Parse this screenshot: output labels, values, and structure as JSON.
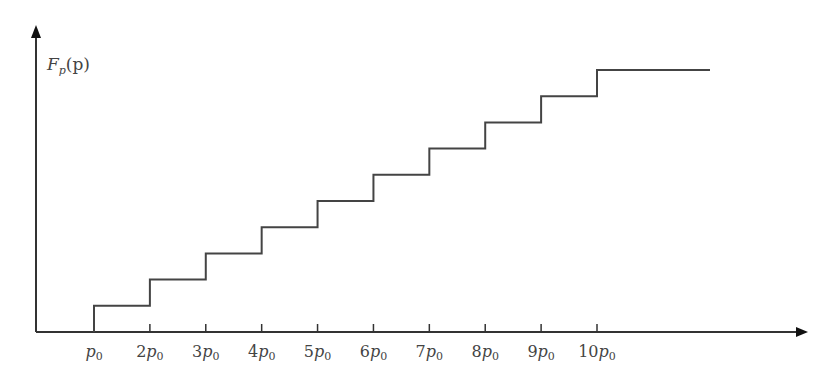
{
  "chart_data": {
    "type": "line",
    "subtype": "step",
    "title": "",
    "ylabel": "F_p(p)",
    "ylabel_display": {
      "main": "F",
      "sub": "p",
      "rest": "(p)"
    },
    "xlabel": "",
    "categories": [
      "p0",
      "2p0",
      "3p0",
      "4p0",
      "5p0",
      "6p0",
      "7p0",
      "8p0",
      "9p0",
      "10p0"
    ],
    "tick_labels": [
      {
        "coef": "",
        "sym": "p",
        "sub": "0"
      },
      {
        "coef": "2",
        "sym": "p",
        "sub": "0"
      },
      {
        "coef": "3",
        "sym": "p",
        "sub": "0"
      },
      {
        "coef": "4",
        "sym": "p",
        "sub": "0"
      },
      {
        "coef": "5",
        "sym": "p",
        "sub": "0"
      },
      {
        "coef": "6",
        "sym": "p",
        "sub": "0"
      },
      {
        "coef": "7",
        "sym": "p",
        "sub": "0"
      },
      {
        "coef": "8",
        "sym": "p",
        "sub": "0"
      },
      {
        "coef": "9",
        "sym": "p",
        "sub": "0"
      },
      {
        "coef": "10",
        "sym": "p",
        "sub": "0"
      }
    ],
    "x": [
      1,
      2,
      3,
      4,
      5,
      6,
      7,
      8,
      9,
      10
    ],
    "values": [
      1,
      2,
      3,
      4,
      5,
      6,
      7,
      8,
      9,
      10
    ],
    "series": [
      {
        "name": "F_p(p)",
        "x": [
          1,
          2,
          3,
          4,
          5,
          6,
          7,
          8,
          9,
          10
        ],
        "values": [
          1,
          2,
          3,
          4,
          5,
          6,
          7,
          8,
          9,
          10
        ]
      }
    ],
    "xlim": [
      0,
      12
    ],
    "ylim": [
      0,
      11
    ],
    "grid": false,
    "legend": "none",
    "color": "#444444"
  }
}
